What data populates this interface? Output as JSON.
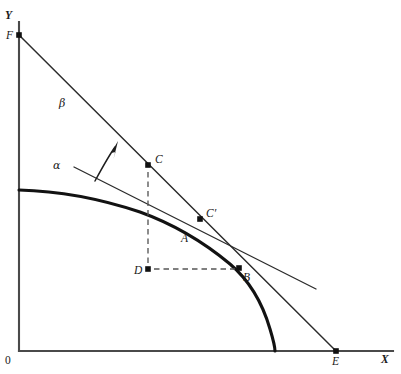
{
  "figure": {
    "type": "economics-diagram",
    "background_color": "#ffffff",
    "ink_color": "#1a1a1a"
  },
  "axes": {
    "y_label": "Y",
    "x_label": "X",
    "origin_label": "0",
    "y_axis": {
      "x": 19,
      "top": 22,
      "bottom": 351
    },
    "x_axis": {
      "y": 351,
      "left": 19,
      "right": 393
    }
  },
  "curves": {
    "ppf": {
      "name": "ppf-curve",
      "style": "thick-solid",
      "points": [
        [
          19,
          190
        ],
        [
          60,
          192
        ],
        [
          100,
          199
        ],
        [
          140,
          212
        ],
        [
          175,
          228
        ],
        [
          205,
          245
        ],
        [
          228,
          260
        ],
        [
          245,
          275
        ],
        [
          258,
          294
        ],
        [
          267,
          315
        ],
        [
          273,
          336
        ],
        [
          275,
          351
        ]
      ]
    },
    "budget_line_beta": {
      "name": "budget-line-beta",
      "label": "β",
      "style": "thin-solid",
      "from": [
        19,
        35
      ],
      "to": [
        336,
        351
      ],
      "label_pos": [
        61,
        104
      ]
    },
    "tangent_line_alpha": {
      "name": "tangent-line-alpha",
      "label": "α",
      "style": "thin-solid",
      "from": [
        74,
        167
      ],
      "to": [
        316,
        289
      ],
      "label_pos": [
        56,
        166
      ]
    }
  },
  "arrow": {
    "name": "shift-arrow",
    "from": [
      95,
      181
    ],
    "to": [
      117,
      142
    ],
    "meaning": "outward shift of budget line"
  },
  "points": [
    {
      "id": "F",
      "label": "F",
      "x": 19,
      "y": 35,
      "marker": true,
      "label_x": 6,
      "label_y": 38,
      "note": "budget line y-intercept"
    },
    {
      "id": "C",
      "label": "C",
      "x": 148,
      "y": 165,
      "marker": true,
      "label_x": 155,
      "label_y": 163,
      "note": "point on budget line beta"
    },
    {
      "id": "Cprime",
      "label": "C′",
      "x": 200,
      "y": 219,
      "marker": true,
      "label_x": 206,
      "label_y": 217,
      "note": "point on budget line beta"
    },
    {
      "id": "A",
      "label": "A",
      "x": 183,
      "y": 234,
      "marker": false,
      "label_x": 183,
      "label_y": 241,
      "note": "label on ppf curve"
    },
    {
      "id": "B",
      "label": "B",
      "x": 239,
      "y": 268,
      "marker": true,
      "label_x": 243,
      "label_y": 280,
      "note": "tangency point of alpha with ppf"
    },
    {
      "id": "D",
      "label": "D",
      "x": 148,
      "y": 269,
      "marker": true,
      "label_x": 135,
      "label_y": 273,
      "note": "corner of dashed rectangle"
    },
    {
      "id": "E",
      "label": "E",
      "x": 336,
      "y": 351,
      "marker": true,
      "label_x": 332,
      "label_y": 364,
      "note": "budget line x-intercept"
    }
  ],
  "guides": [
    {
      "name": "dashed-vertical-C-D",
      "from": [
        148,
        172
      ],
      "to": [
        148,
        266
      ],
      "style": "dashed"
    },
    {
      "name": "dashed-horizontal-D-B",
      "from": [
        153,
        269
      ],
      "to": [
        236,
        269
      ],
      "style": "dashed"
    }
  ],
  "labels": {
    "alpha": "α",
    "beta": "β",
    "y_axis": "Y",
    "x_axis": "X",
    "origin": "0"
  }
}
